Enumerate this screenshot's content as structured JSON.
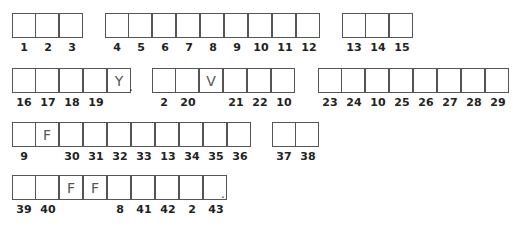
{
  "rows": [
    {
      "top": 13,
      "groups": [
        {
          "left": 12,
          "cells": [
            {
              "n": "1",
              "l": ""
            },
            {
              "n": "2",
              "l": ""
            },
            {
              "n": "3",
              "l": ""
            }
          ]
        },
        {
          "left": 105,
          "cells": [
            {
              "n": "4",
              "l": ""
            },
            {
              "n": "5",
              "l": ""
            },
            {
              "n": "6",
              "l": ""
            },
            {
              "n": "7",
              "l": ""
            },
            {
              "n": "8",
              "l": ""
            },
            {
              "n": "9",
              "l": ""
            },
            {
              "n": "10",
              "l": ""
            },
            {
              "n": "11",
              "l": ""
            },
            {
              "n": "12",
              "l": ""
            }
          ]
        },
        {
          "left": 342,
          "cells": [
            {
              "n": "13",
              "l": ""
            },
            {
              "n": "14",
              "l": ""
            },
            {
              "n": "15",
              "l": ""
            }
          ]
        }
      ]
    },
    {
      "top": 68,
      "groups": [
        {
          "left": 12,
          "cells": [
            {
              "n": "16",
              "l": ""
            },
            {
              "n": "17",
              "l": ""
            },
            {
              "n": "18",
              "l": ""
            },
            {
              "n": "19",
              "l": ""
            },
            {
              "n": "",
              "l": "Y"
            }
          ],
          "period": true
        },
        {
          "left": 152,
          "cells": [
            {
              "n": "2",
              "l": ""
            },
            {
              "n": "20",
              "l": ""
            },
            {
              "n": "",
              "l": "V"
            },
            {
              "n": "21",
              "l": ""
            },
            {
              "n": "22",
              "l": ""
            },
            {
              "n": "10",
              "l": ""
            }
          ]
        },
        {
          "left": 318,
          "cells": [
            {
              "n": "23",
              "l": ""
            },
            {
              "n": "24",
              "l": ""
            },
            {
              "n": "10",
              "l": ""
            },
            {
              "n": "25",
              "l": ""
            },
            {
              "n": "26",
              "l": ""
            },
            {
              "n": "27",
              "l": ""
            },
            {
              "n": "28",
              "l": ""
            },
            {
              "n": "29",
              "l": ""
            }
          ]
        }
      ]
    },
    {
      "top": 122,
      "groups": [
        {
          "left": 12,
          "cells": [
            {
              "n": "9",
              "l": ""
            },
            {
              "n": "",
              "l": "F"
            },
            {
              "n": "30",
              "l": ""
            },
            {
              "n": "31",
              "l": ""
            },
            {
              "n": "32",
              "l": ""
            },
            {
              "n": "33",
              "l": ""
            },
            {
              "n": "13",
              "l": ""
            },
            {
              "n": "34",
              "l": ""
            },
            {
              "n": "35",
              "l": ""
            },
            {
              "n": "36",
              "l": ""
            }
          ]
        },
        {
          "left": 272,
          "cells": [
            {
              "n": "37",
              "l": ""
            },
            {
              "n": "38",
              "l": ""
            }
          ]
        }
      ]
    },
    {
      "top": 175,
      "groups": [
        {
          "left": 12,
          "cells": [
            {
              "n": "39",
              "l": ""
            },
            {
              "n": "40",
              "l": ""
            },
            {
              "n": "",
              "l": "F"
            },
            {
              "n": "",
              "l": "F"
            },
            {
              "n": "8",
              "l": ""
            },
            {
              "n": "41",
              "l": ""
            },
            {
              "n": "42",
              "l": ""
            },
            {
              "n": "2",
              "l": ""
            },
            {
              "n": "43",
              "l": ""
            }
          ],
          "period": true
        }
      ]
    }
  ]
}
